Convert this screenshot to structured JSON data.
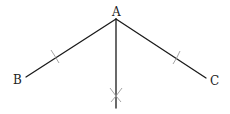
{
  "diagram": {
    "points": {
      "A": {
        "label": "A",
        "x": 116,
        "y": 19
      },
      "B": {
        "label": "B",
        "x": 26,
        "y": 77
      },
      "C": {
        "label": "C",
        "x": 206,
        "y": 78
      }
    },
    "labels": {
      "A": "A",
      "B": "B",
      "C": "C"
    },
    "segments": [
      "AB",
      "AC",
      "bisector of angle BAC"
    ],
    "construction_marks": {
      "arc_on_AB": {
        "x": 56,
        "y": 57
      },
      "arc_on_AC": {
        "x": 176,
        "y": 58
      },
      "intersecting_arcs": {
        "x": 116,
        "y": 96
      }
    },
    "colors": {
      "line": "#1a1a1a",
      "arc": "#9a9a9a",
      "text": "#222222",
      "background": "#ffffff"
    }
  }
}
